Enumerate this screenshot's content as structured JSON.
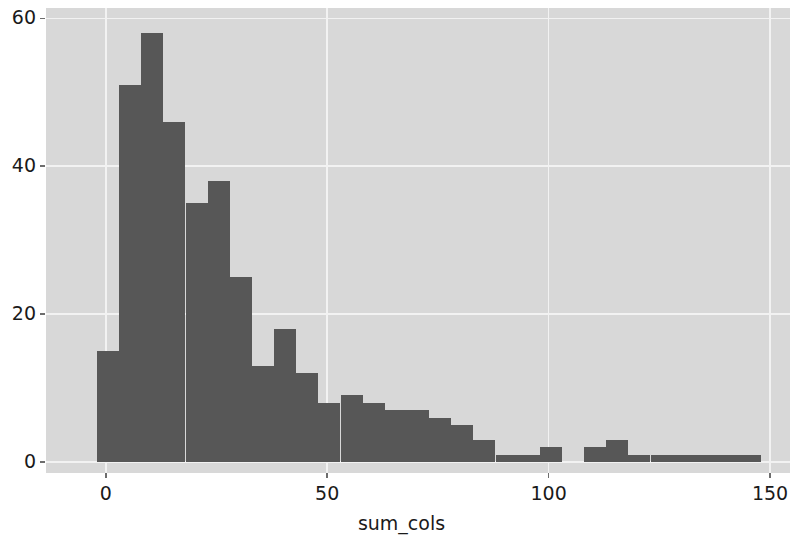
{
  "chart_data": {
    "type": "bar",
    "title": "",
    "subtitle": "",
    "xlabel": "sum_cols",
    "ylabel": "",
    "histogram": true,
    "bin_width": 5,
    "bin_start": -2,
    "xlim": [
      -13.5,
      154.5
    ],
    "ylim": [
      -1.5,
      61.4
    ],
    "xticks": [
      0,
      50,
      100,
      150
    ],
    "xtick_labels": [
      "0",
      "50",
      "100",
      "150"
    ],
    "yticks": [
      0,
      20,
      40,
      60
    ],
    "ytick_labels": [
      "0",
      "20",
      "40",
      "60"
    ],
    "grid": true,
    "grid_color": "#f2f2f2",
    "axes_facecolor": "#d8d8d8",
    "figure_facecolor": "#ffffff",
    "bar_color": "#575757",
    "legend": null,
    "annotations": [],
    "bin_edges": [
      -2,
      3,
      8,
      13,
      18,
      23,
      28,
      33,
      38,
      43,
      48,
      53,
      58,
      63,
      68,
      73,
      78,
      83,
      88,
      93,
      98,
      103,
      108,
      113,
      118,
      123,
      128,
      133,
      138,
      143,
      148
    ],
    "bin_centers": [
      0.5,
      5.5,
      10.5,
      15.5,
      20.5,
      25.5,
      30.5,
      35.5,
      40.5,
      45.5,
      50.5,
      55.5,
      60.5,
      65.5,
      70.5,
      75.5,
      80.5,
      85.5,
      90.5,
      95.5,
      100.5,
      105.5,
      110.5,
      115.5,
      120.5,
      125.5,
      130.5,
      135.5,
      140.5,
      145.5
    ],
    "values": [
      15,
      51,
      58,
      46,
      35,
      38,
      25,
      13,
      18,
      12,
      8,
      9,
      8,
      7,
      7,
      6,
      5,
      3,
      1,
      1,
      2,
      0,
      2,
      3,
      1,
      1,
      1,
      1,
      1,
      1
    ],
    "values_label": "count"
  },
  "axis": {
    "x_axis_label": "sum_cols",
    "y_axis_label": ""
  }
}
